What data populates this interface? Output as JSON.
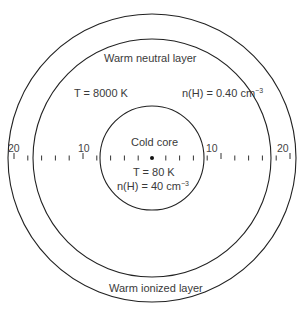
{
  "diagram": {
    "center": {
      "x": 152,
      "y": 158
    },
    "circles": [
      {
        "name": "outer-boundary",
        "r": 144
      },
      {
        "name": "neutral-boundary",
        "r": 119
      },
      {
        "name": "core-boundary",
        "r": 52
      }
    ],
    "stroke_color": "#222222",
    "axis": {
      "tick_spacing_px": 13.8,
      "ticks_each_side": 10,
      "labels": [
        {
          "text": "20",
          "x": 8,
          "y": 146
        },
        {
          "text": "10",
          "x": 78,
          "y": 146
        },
        {
          "text": "10",
          "x": 206,
          "y": 146
        },
        {
          "text": "20",
          "x": 278,
          "y": 146
        }
      ]
    }
  },
  "labels": {
    "warm_neutral_layer": "Warm neutral layer",
    "warm_neutral_T": "T = 8000 K",
    "warm_neutral_nH_prefix": "n(H) = 0.40 cm",
    "warm_neutral_nH_exp": "−3",
    "cold_core": "Cold core",
    "cold_core_T": "T = 80 K",
    "cold_core_nH_prefix": "n(H) = 40 cm",
    "cold_core_nH_exp": "−3",
    "warm_ionized_layer": "Warm ionized layer"
  }
}
